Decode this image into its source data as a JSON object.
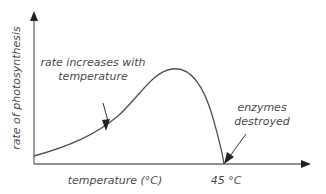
{
  "diagram": {
    "y_axis_label": "rate of photosynthesis",
    "x_axis_label": "temperature (°C)",
    "x_marker_label": "45 °C",
    "annotations": [
      {
        "lines": [
          "rate increases with",
          "temperature"
        ]
      },
      {
        "lines": [
          "enzymes",
          "destroyed"
        ]
      }
    ],
    "colors": {
      "axis": "#6a6a6a",
      "curve": "#4f4f4f",
      "text": "#4a4a4a"
    }
  }
}
